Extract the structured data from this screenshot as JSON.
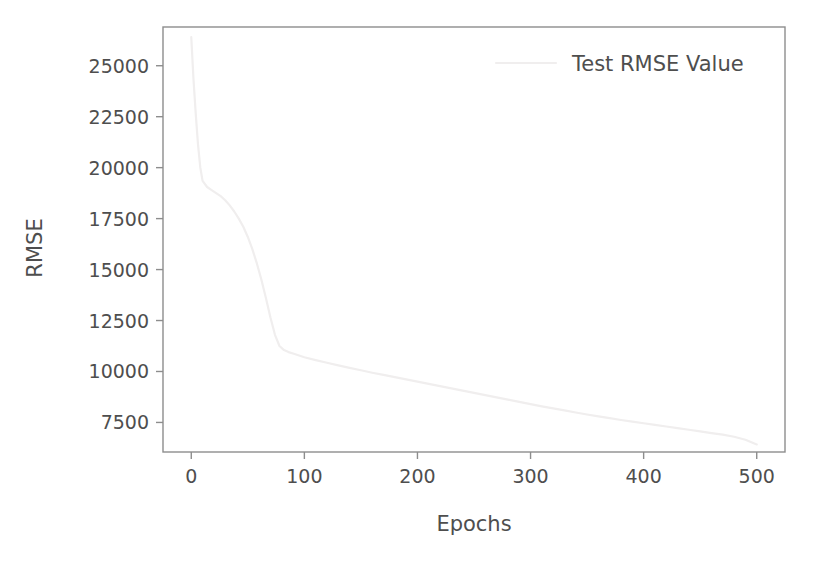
{
  "chart_data": {
    "type": "line",
    "title": "",
    "xlabel": "Epochs",
    "ylabel": "RMSE",
    "xlim": [
      -25,
      525
    ],
    "ylim": [
      6050,
      26900
    ],
    "grid": false,
    "legend_position": "top-right",
    "legend_entries": [
      "Test RMSE Value"
    ],
    "xticks": [
      0,
      100,
      200,
      300,
      400,
      500
    ],
    "xtick_labels": [
      "0",
      "100",
      "200",
      "300",
      "400",
      "500"
    ],
    "yticks": [
      7500,
      10000,
      12500,
      15000,
      17500,
      20000,
      22500,
      25000
    ],
    "ytick_labels": [
      "7500",
      "10000",
      "12500",
      "15000",
      "17500",
      "20000",
      "22500",
      "25000"
    ],
    "series": [
      {
        "name": "Test RMSE Value",
        "color": "#f0eeee",
        "linewidth": 2.2,
        "x": [
          0,
          2,
          4,
          6,
          8,
          10,
          14,
          18,
          22,
          26,
          30,
          34,
          38,
          42,
          46,
          50,
          54,
          58,
          62,
          66,
          70,
          74,
          78,
          82,
          86,
          90,
          100,
          110,
          120,
          130,
          140,
          150,
          160,
          170,
          180,
          190,
          200,
          210,
          220,
          230,
          240,
          250,
          260,
          270,
          280,
          290,
          300,
          310,
          320,
          330,
          340,
          350,
          360,
          370,
          380,
          390,
          400,
          410,
          420,
          430,
          440,
          450,
          460,
          470,
          480,
          490,
          500
        ],
        "y": [
          26400,
          24300,
          22600,
          21100,
          20000,
          19350,
          19050,
          18900,
          18750,
          18600,
          18400,
          18150,
          17850,
          17500,
          17100,
          16600,
          16000,
          15300,
          14500,
          13600,
          12650,
          11800,
          11250,
          11050,
          10950,
          10880,
          10700,
          10560,
          10430,
          10300,
          10180,
          10060,
          9940,
          9830,
          9720,
          9610,
          9500,
          9390,
          9280,
          9170,
          9060,
          8950,
          8840,
          8730,
          8620,
          8510,
          8400,
          8290,
          8190,
          8090,
          7990,
          7890,
          7800,
          7710,
          7620,
          7540,
          7460,
          7380,
          7300,
          7220,
          7140,
          7060,
          6980,
          6900,
          6800,
          6650,
          6420
        ]
      }
    ]
  },
  "axes": {
    "frame_color": "#8d8d8d",
    "text_color": "#4e4e4e"
  }
}
